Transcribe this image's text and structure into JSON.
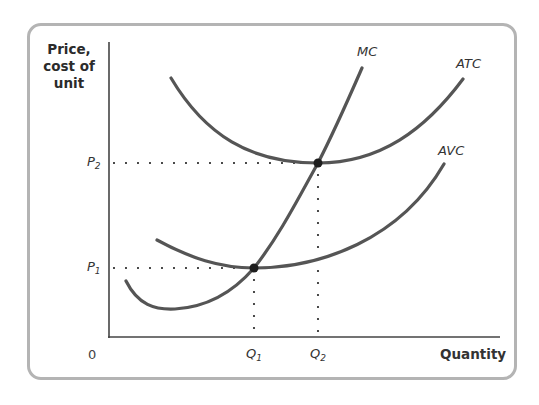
{
  "diagram": {
    "y_axis_label": "Price, cost of unit",
    "x_axis_label": "Quantity",
    "origin_label": "0",
    "curves": [
      {
        "id": "MC",
        "label": "MC"
      },
      {
        "id": "ATC",
        "label": "ATC"
      },
      {
        "id": "AVC",
        "label": "AVC"
      }
    ],
    "price_levels": [
      {
        "symbol": "P",
        "sub": "2",
        "meaning": "minimum ATC (MC = ATC)"
      },
      {
        "symbol": "P",
        "sub": "1",
        "meaning": "minimum AVC (MC = AVC)"
      }
    ],
    "quantity_levels": [
      {
        "symbol": "Q",
        "sub": "1"
      },
      {
        "symbol": "Q",
        "sub": "2"
      }
    ],
    "colors": {
      "curve": "#555555",
      "axis": "#444444",
      "dot": "#1e1e1e",
      "frame": "#b4b4b4"
    }
  }
}
